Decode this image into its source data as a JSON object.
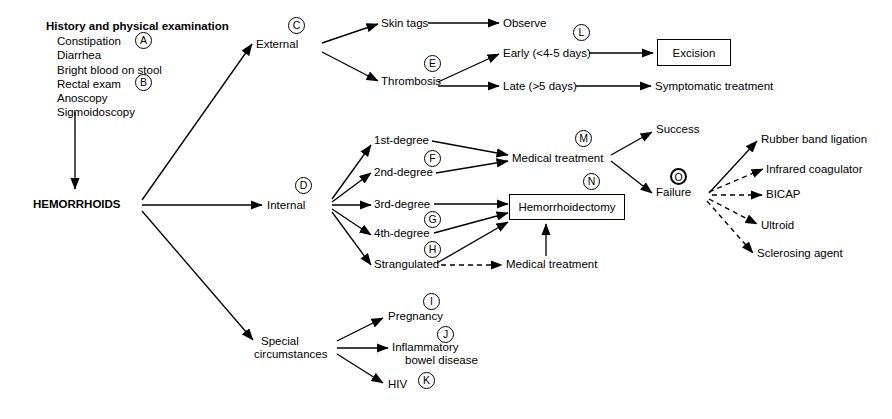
{
  "diagram": {
    "title_block": {
      "title": "History and physical examination",
      "items": [
        "Constipation",
        "Diarrhea",
        "Bright blood on stool",
        "Rectal exam",
        "Anoscopy",
        "Sigmoidoscopy"
      ]
    },
    "root": "HEMORRHOIDS",
    "nodes": {
      "external": "External",
      "internal": "Internal",
      "special": "Special circumstances",
      "special_line1": "Special",
      "special_line2": "circumstances",
      "skin_tags": "Skin tags",
      "thrombosis": "Thrombosis",
      "observe": "Observe",
      "early": "Early (<4-5 days)",
      "late": "Late (>5 days)",
      "excision": "Excision",
      "symptomatic_treatment": "Symptomatic treatment",
      "first_degree": "1st-degree",
      "second_degree": "2nd-degree",
      "third_degree": "3rd-degree",
      "fourth_degree": "4th-degree",
      "strangulated": "Strangulated",
      "medical_treatment": "Medical treatment",
      "hemorrhoidectomy": "Hemorrhoidectomy",
      "medical_treatment_2": "Medical treatment",
      "success": "Success",
      "failure": "Failure",
      "rubber_band": "Rubber band ligation",
      "infrared": "Infrared coagulator",
      "bicap": "BICAP",
      "ultroid": "Ultroid",
      "sclerosing": "Sclerosing agent",
      "pregnancy": "Pregnancy",
      "ibd_line1": "Inflammatory",
      "ibd_line2": "bowel disease",
      "hiv": "HIV"
    },
    "markers": {
      "a": "A",
      "b": "B",
      "c": "C",
      "d": "D",
      "e": "E",
      "f": "F",
      "g": "G",
      "h": "H",
      "i": "I",
      "j": "J",
      "k": "K",
      "l": "L",
      "m": "M",
      "n": "N",
      "o": "O"
    },
    "colors": {
      "line": "#000000",
      "background": "#ffffff",
      "text": "#000000"
    }
  }
}
